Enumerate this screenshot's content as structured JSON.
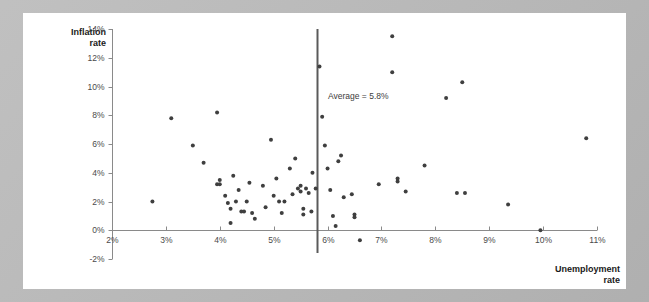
{
  "chart_data": {
    "type": "scatter",
    "title": "",
    "xlabel": "Unemployment rate",
    "ylabel": "Inflation rate",
    "xlim": [
      2,
      11
    ],
    "ylim": [
      -2,
      14
    ],
    "xticks": [
      "2%",
      "3%",
      "4%",
      "5%",
      "6%",
      "7%",
      "8%",
      "9%",
      "10%",
      "11%"
    ],
    "xtick_values": [
      2,
      3,
      4,
      5,
      6,
      7,
      8,
      9,
      10,
      11
    ],
    "yticks": [
      "14%",
      "12%",
      "10%",
      "8%",
      "6%",
      "4%",
      "2%",
      "0%",
      "-2%"
    ],
    "ytick_values": [
      14,
      12,
      10,
      8,
      6,
      4,
      2,
      0,
      -2
    ],
    "grid": false,
    "legend": null,
    "marker_color": "#3f3f3f",
    "marker_size": 4,
    "annotations": [
      {
        "name": "average-line-label",
        "text": "Average = 5.8%",
        "x": 6.0,
        "y": 9.2
      }
    ],
    "reference_lines": [
      {
        "name": "average-unemployment-line",
        "orientation": "vertical",
        "value": 5.8,
        "color": "#5a5a5a",
        "label": "Average = 5.8%"
      }
    ],
    "points": [
      {
        "x": 2.75,
        "y": 2.0
      },
      {
        "x": 3.1,
        "y": 7.8
      },
      {
        "x": 3.5,
        "y": 5.9
      },
      {
        "x": 3.7,
        "y": 4.7
      },
      {
        "x": 3.95,
        "y": 8.2
      },
      {
        "x": 3.95,
        "y": 3.2
      },
      {
        "x": 4.0,
        "y": 3.5
      },
      {
        "x": 4.0,
        "y": 3.2
      },
      {
        "x": 4.1,
        "y": 2.4
      },
      {
        "x": 4.15,
        "y": 1.9
      },
      {
        "x": 4.2,
        "y": 1.5
      },
      {
        "x": 4.2,
        "y": 0.5
      },
      {
        "x": 4.25,
        "y": 3.8
      },
      {
        "x": 4.3,
        "y": 2.0
      },
      {
        "x": 4.35,
        "y": 2.8
      },
      {
        "x": 4.4,
        "y": 1.3
      },
      {
        "x": 4.45,
        "y": 1.3
      },
      {
        "x": 4.5,
        "y": 2.0
      },
      {
        "x": 4.55,
        "y": 3.3
      },
      {
        "x": 4.6,
        "y": 1.2
      },
      {
        "x": 4.65,
        "y": 0.8
      },
      {
        "x": 4.8,
        "y": 3.1
      },
      {
        "x": 4.85,
        "y": 1.6
      },
      {
        "x": 4.95,
        "y": 6.3
      },
      {
        "x": 5.0,
        "y": 2.4
      },
      {
        "x": 5.05,
        "y": 3.6
      },
      {
        "x": 5.1,
        "y": 2.0
      },
      {
        "x": 5.15,
        "y": 1.2
      },
      {
        "x": 5.2,
        "y": 2.0
      },
      {
        "x": 5.3,
        "y": 4.3
      },
      {
        "x": 5.35,
        "y": 2.5
      },
      {
        "x": 5.4,
        "y": 5.0
      },
      {
        "x": 5.45,
        "y": 2.9
      },
      {
        "x": 5.5,
        "y": 2.7
      },
      {
        "x": 5.5,
        "y": 3.1
      },
      {
        "x": 5.55,
        "y": 1.5
      },
      {
        "x": 5.55,
        "y": 1.1
      },
      {
        "x": 5.6,
        "y": 2.9
      },
      {
        "x": 5.65,
        "y": 2.6
      },
      {
        "x": 5.7,
        "y": 1.3
      },
      {
        "x": 5.72,
        "y": 4.0
      },
      {
        "x": 5.78,
        "y": 2.9
      },
      {
        "x": 5.85,
        "y": 11.4
      },
      {
        "x": 5.9,
        "y": 7.9
      },
      {
        "x": 5.95,
        "y": 5.9
      },
      {
        "x": 6.0,
        "y": 4.3
      },
      {
        "x": 6.05,
        "y": 2.8
      },
      {
        "x": 6.1,
        "y": 1.0
      },
      {
        "x": 6.15,
        "y": 0.3
      },
      {
        "x": 6.2,
        "y": 4.8
      },
      {
        "x": 6.25,
        "y": 5.2
      },
      {
        "x": 6.3,
        "y": 2.3
      },
      {
        "x": 6.45,
        "y": 2.5
      },
      {
        "x": 6.5,
        "y": 1.1
      },
      {
        "x": 6.5,
        "y": 0.9
      },
      {
        "x": 6.6,
        "y": -0.7
      },
      {
        "x": 6.95,
        "y": 3.2
      },
      {
        "x": 7.2,
        "y": 13.5
      },
      {
        "x": 7.2,
        "y": 11.0
      },
      {
        "x": 7.3,
        "y": 3.6
      },
      {
        "x": 7.3,
        "y": 3.4
      },
      {
        "x": 7.45,
        "y": 2.7
      },
      {
        "x": 7.8,
        "y": 4.5
      },
      {
        "x": 8.2,
        "y": 9.2
      },
      {
        "x": 8.4,
        "y": 2.6
      },
      {
        "x": 8.5,
        "y": 10.3
      },
      {
        "x": 8.55,
        "y": 2.6
      },
      {
        "x": 9.35,
        "y": 1.8
      },
      {
        "x": 9.95,
        "y": 0.0
      },
      {
        "x": 10.8,
        "y": 6.4
      }
    ]
  },
  "axes": {
    "y_title": "Inflation\nrate",
    "x_title": "Unemployment\nrate"
  }
}
